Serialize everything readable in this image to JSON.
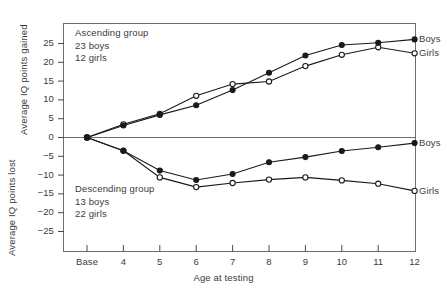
{
  "chart_data": {
    "type": "line",
    "title": "",
    "xlabel": "Age at testing",
    "ylabel_upper": "Average IQ points gained",
    "ylabel_lower": "Average IQ points lost",
    "x_categories": [
      "Base",
      "4",
      "5",
      "6",
      "7",
      "8",
      "9",
      "10",
      "11",
      "12"
    ],
    "ylim": [
      -27.5,
      27.5
    ],
    "yticks": [
      25,
      20,
      15,
      10,
      5,
      0,
      -5,
      -10,
      -15,
      -20,
      -25
    ],
    "ytick_labels": [
      "25",
      "20",
      "15",
      "10",
      "5",
      "0",
      "−5",
      "−10",
      "−15",
      "−20",
      "−25"
    ],
    "grid": false,
    "zero_line": true,
    "legend_position": "right-of-line-ends",
    "series": [
      {
        "name": "Ascending group – Boys",
        "label": "Boys",
        "marker": "filled-circle",
        "group": "ascending",
        "values": [
          0,
          3.2,
          6.0,
          8.6,
          12.6,
          17.2,
          21.8,
          24.6,
          25.2,
          26.1
        ]
      },
      {
        "name": "Ascending group – Girls",
        "label": "Girls",
        "marker": "open-circle",
        "group": "ascending",
        "values": [
          0,
          3.5,
          6.3,
          11.1,
          14.2,
          14.9,
          19.0,
          22.0,
          24.0,
          22.4
        ]
      },
      {
        "name": "Descending group – Boys",
        "label": "Boys",
        "marker": "filled-circle",
        "group": "descending",
        "values": [
          0,
          -3.5,
          -8.8,
          -11.3,
          -9.7,
          -6.6,
          -5.2,
          -3.6,
          -2.6,
          -1.5
        ]
      },
      {
        "name": "Descending group – Girls",
        "label": "Girls",
        "marker": "open-circle",
        "group": "descending",
        "values": [
          0,
          -3.5,
          -10.6,
          -13.2,
          -12.1,
          -11.2,
          -10.6,
          -11.4,
          -12.3,
          -14.2
        ]
      }
    ],
    "annotations": [
      {
        "id": "ascending",
        "lines": [
          "Ascending group",
          "23 boys",
          "12 girls"
        ]
      },
      {
        "id": "descending",
        "lines": [
          "Descending group",
          "13 boys",
          "22 girls"
        ]
      }
    ],
    "colors": {
      "line": "#1a1a1a",
      "marker_fill": "#1a1a1a",
      "marker_open": "#ffffff",
      "axis": "#6e6e6e",
      "zero_line": "#6e6e6e",
      "text": "#3b3b3b",
      "background": "#ffffff"
    }
  },
  "annotation_ascending": {
    "line1": "Ascending group",
    "line2": "23 boys",
    "line3": "12 girls"
  },
  "annotation_descending": {
    "line1": "Descending group",
    "line2": "13 boys",
    "line3": "22 girls"
  },
  "axis": {
    "x_title": "Age at testing",
    "y_title_upper": "Average IQ points gained",
    "y_title_lower": "Average IQ points lost"
  },
  "ytick": {
    "t0": "25",
    "t1": "20",
    "t2": "15",
    "t3": "10",
    "t4": "5",
    "t5": "0",
    "t6": "−5",
    "t7": "−10",
    "t8": "−15",
    "t9": "−20",
    "t10": "−25"
  },
  "xtick": {
    "t0": "Base",
    "t1": "4",
    "t2": "5",
    "t3": "6",
    "t4": "7",
    "t5": "8",
    "t6": "9",
    "t7": "10",
    "t8": "11",
    "t9": "12"
  },
  "series_labels": {
    "asc_boys": "Boys",
    "asc_girls": "Girls",
    "desc_boys": "Boys",
    "desc_girls": "Girls"
  }
}
